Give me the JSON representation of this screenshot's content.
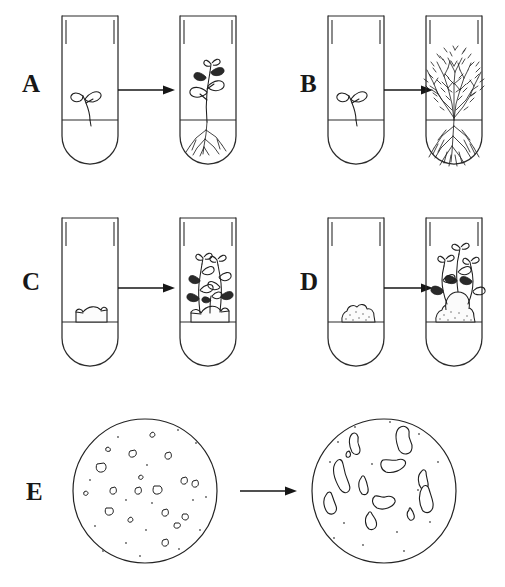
{
  "figure": {
    "width": 505,
    "height": 587,
    "background_color": "#ffffff",
    "ink_color": "#1f1f1f"
  },
  "panels": [
    {
      "id": "A",
      "label": "A",
      "label_x": 22,
      "label_y": 92,
      "vessel_type": "test-tube",
      "before": {
        "content": "seedling",
        "description": "small seedling with two leaves on medium surface",
        "tube_x": 62,
        "tube_y": 16
      },
      "arrow": {
        "x1": 118,
        "y1": 90,
        "x2": 172,
        "y2": 90
      },
      "after": {
        "content": "rooted-plantlet",
        "description": "elongated plantlet with several leaves and branched root system",
        "tube_x": 180,
        "tube_y": 16
      }
    },
    {
      "id": "B",
      "label": "B",
      "label_x": 300,
      "label_y": 92,
      "vessel_type": "test-tube",
      "before": {
        "content": "seedling",
        "description": "small seedling with two leaves on medium surface",
        "tube_x": 328,
        "tube_y": 16
      },
      "arrow": {
        "x1": 382,
        "y1": 90,
        "x2": 436,
        "y2": 90
      },
      "after": {
        "content": "multiple-shoot-bush",
        "description": "dense bushy mass of many shoots with extensive root system",
        "tube_x": 426,
        "tube_y": 16
      }
    },
    {
      "id": "C",
      "label": "C",
      "label_x": 22,
      "label_y": 290,
      "vessel_type": "test-tube",
      "before": {
        "content": "leaf-explant",
        "description": "curved leaf explant segment resting on medium",
        "tube_x": 62,
        "tube_y": 218
      },
      "arrow": {
        "x1": 118,
        "y1": 288,
        "x2": 172,
        "y2": 288
      },
      "after": {
        "content": "shoots-from-explant",
        "description": "explant with several regenerated leafy shoots",
        "tube_x": 180,
        "tube_y": 218
      }
    },
    {
      "id": "D",
      "label": "D",
      "label_x": 300,
      "label_y": 290,
      "vessel_type": "test-tube",
      "before": {
        "content": "callus",
        "description": "lumpy undifferentiated callus mass on medium",
        "tube_x": 328,
        "tube_y": 218
      },
      "arrow": {
        "x1": 382,
        "y1": 288,
        "x2": 436,
        "y2": 288
      },
      "after": {
        "content": "shoots-from-callus",
        "description": "callus mass with regenerated leafy shoots",
        "tube_x": 426,
        "tube_y": 218
      }
    },
    {
      "id": "E",
      "label": "E",
      "label_x": 26,
      "label_y": 500,
      "vessel_type": "petri-dish",
      "before": {
        "content": "protoplast-colonies-small",
        "description": "petri dish with many small cell colonies and scattered cells",
        "dish_cx": 145,
        "dish_cy": 491,
        "dish_r": 72,
        "colony_count": 18
      },
      "arrow": {
        "x1": 240,
        "y1": 491,
        "x2": 296,
        "y2": 491
      },
      "after": {
        "content": "protoplast-colonies-large",
        "description": "petri dish with fewer, much larger irregular colonies",
        "dish_cx": 384,
        "dish_cy": 491,
        "dish_r": 72,
        "colony_count": 12
      }
    }
  ],
  "tube": {
    "width": 56,
    "body_height": 148,
    "rim_inset": 4,
    "rim_height": 26,
    "medium_level_offset": 104,
    "bottom_radius": 28
  },
  "colonies_small": [
    {
      "cx": 108,
      "cy": 450,
      "rx": 2.0,
      "ry": 1.8
    },
    {
      "cx": 153,
      "cy": 435,
      "rx": 2.4,
      "ry": 2.0
    },
    {
      "cx": 133,
      "cy": 454,
      "rx": 3.6,
      "ry": 3.2
    },
    {
      "cx": 169,
      "cy": 456,
      "rx": 3.0,
      "ry": 3.4
    },
    {
      "cx": 102,
      "cy": 468,
      "rx": 4.6,
      "ry": 4.0
    },
    {
      "cx": 141,
      "cy": 478,
      "rx": 2.0,
      "ry": 1.8
    },
    {
      "cx": 185,
      "cy": 481,
      "rx": 3.2,
      "ry": 3.0
    },
    {
      "cx": 196,
      "cy": 484,
      "rx": 3.4,
      "ry": 3.2
    },
    {
      "cx": 86,
      "cy": 494,
      "rx": 2.0,
      "ry": 1.8
    },
    {
      "cx": 114,
      "cy": 491,
      "rx": 3.4,
      "ry": 3.0
    },
    {
      "cx": 139,
      "cy": 491,
      "rx": 3.2,
      "ry": 3.2
    },
    {
      "cx": 158,
      "cy": 490,
      "rx": 4.4,
      "ry": 4.2
    },
    {
      "cx": 110,
      "cy": 512,
      "rx": 4.0,
      "ry": 3.6
    },
    {
      "cx": 131,
      "cy": 520,
      "rx": 2.6,
      "ry": 2.4
    },
    {
      "cx": 166,
      "cy": 513,
      "rx": 3.0,
      "ry": 3.0
    },
    {
      "cx": 186,
      "cy": 517,
      "rx": 3.2,
      "ry": 2.8
    },
    {
      "cx": 178,
      "cy": 526,
      "rx": 2.8,
      "ry": 2.6
    },
    {
      "cx": 166,
      "cy": 543,
      "rx": 3.0,
      "ry": 3.2
    }
  ],
  "dots_small": [
    {
      "cx": 118,
      "cy": 437
    },
    {
      "cx": 178,
      "cy": 430
    },
    {
      "cx": 196,
      "cy": 443
    },
    {
      "cx": 147,
      "cy": 465
    },
    {
      "cx": 90,
      "cy": 480
    },
    {
      "cx": 126,
      "cy": 500
    },
    {
      "cx": 152,
      "cy": 503
    },
    {
      "cx": 193,
      "cy": 500
    },
    {
      "cx": 206,
      "cy": 497
    },
    {
      "cx": 95,
      "cy": 526
    },
    {
      "cx": 146,
      "cy": 530
    },
    {
      "cx": 200,
      "cy": 530
    },
    {
      "cx": 126,
      "cy": 543
    },
    {
      "cx": 103,
      "cy": 551
    },
    {
      "cx": 140,
      "cy": 556
    },
    {
      "cx": 179,
      "cy": 549
    }
  ],
  "colonies_large": [
    {
      "cx": 356,
      "cy": 443,
      "rx": 7,
      "ry": 10,
      "rot": -8
    },
    {
      "cx": 403,
      "cy": 440,
      "rx": 9,
      "ry": 12,
      "rot": 12
    },
    {
      "cx": 395,
      "cy": 466,
      "rx": 11,
      "ry": 6,
      "rot": -6
    },
    {
      "cx": 341,
      "cy": 474,
      "rx": 7,
      "ry": 13,
      "rot": 28
    },
    {
      "cx": 424,
      "cy": 480,
      "rx": 5,
      "ry": 8,
      "rot": -14
    },
    {
      "cx": 364,
      "cy": 486,
      "rx": 5,
      "ry": 9,
      "rot": 4
    },
    {
      "cx": 330,
      "cy": 504,
      "rx": 7,
      "ry": 10,
      "rot": -4
    },
    {
      "cx": 385,
      "cy": 500,
      "rx": 10,
      "ry": 6,
      "rot": 30
    },
    {
      "cx": 427,
      "cy": 500,
      "rx": 8,
      "ry": 12,
      "rot": 6
    },
    {
      "cx": 372,
      "cy": 521,
      "rx": 7,
      "ry": 8,
      "rot": -18
    },
    {
      "cx": 411,
      "cy": 515,
      "rx": 4,
      "ry": 6,
      "rot": 10
    },
    {
      "cx": 349,
      "cy": 455,
      "rx": 3,
      "ry": 3,
      "rot": 0
    }
  ],
  "dots_large": [
    {
      "cx": 355,
      "cy": 427
    },
    {
      "cx": 390,
      "cy": 422
    },
    {
      "cx": 338,
      "cy": 442
    },
    {
      "cx": 419,
      "cy": 434
    },
    {
      "cx": 330,
      "cy": 462
    },
    {
      "cx": 372,
      "cy": 464
    },
    {
      "cx": 438,
      "cy": 462
    },
    {
      "cx": 418,
      "cy": 490
    },
    {
      "cx": 344,
      "cy": 523
    },
    {
      "cx": 397,
      "cy": 532
    },
    {
      "cx": 430,
      "cy": 522
    },
    {
      "cx": 363,
      "cy": 545
    },
    {
      "cx": 404,
      "cy": 551
    },
    {
      "cx": 334,
      "cy": 538
    }
  ]
}
